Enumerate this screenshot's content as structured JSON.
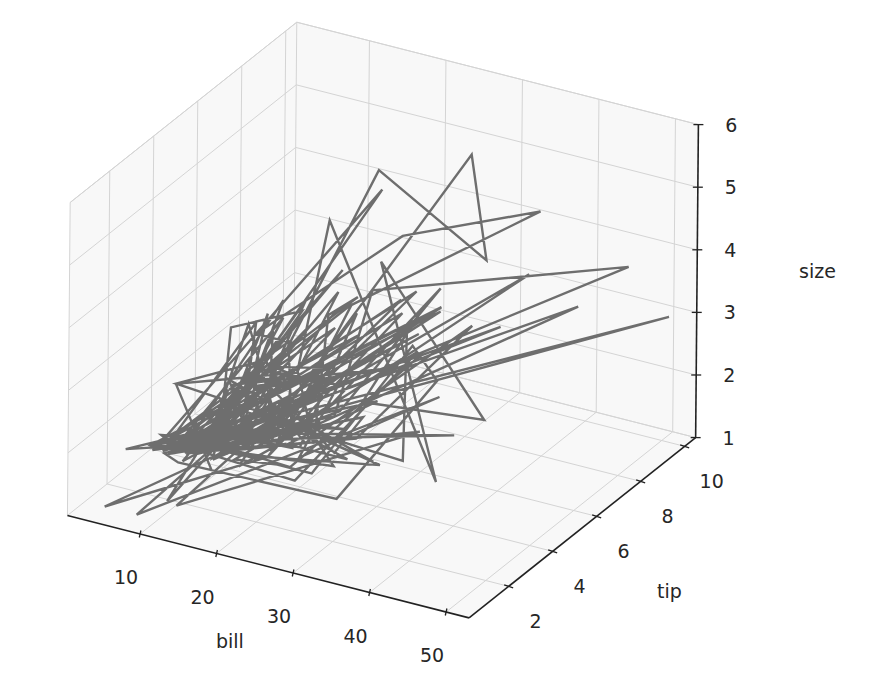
{
  "chart_data": {
    "type": "line3d",
    "title": "",
    "xlabel": "bill",
    "ylabel": "tip",
    "zlabel": "size",
    "x_ticks": [
      10,
      20,
      30,
      40,
      50
    ],
    "y_ticks": [
      2,
      4,
      6,
      8,
      10
    ],
    "z_ticks": [
      1,
      2,
      3,
      4,
      5,
      6
    ],
    "xlim": [
      0.5,
      53
    ],
    "ylim": [
      0.2,
      10.5
    ],
    "zlim": [
      1,
      6
    ],
    "grid": true,
    "legend": null,
    "series": [
      {
        "name": "tips",
        "color": "#6e6e6e",
        "bill": [
          16.99,
          10.34,
          21.01,
          23.68,
          24.59,
          25.29,
          8.77,
          26.88,
          15.04,
          14.78,
          10.27,
          35.26,
          15.42,
          18.43,
          14.83,
          21.58,
          10.33,
          16.29,
          16.97,
          20.65,
          17.92,
          20.29,
          15.77,
          39.42,
          19.82,
          17.81,
          13.37,
          12.69,
          21.7,
          19.65,
          9.55,
          18.35,
          15.06,
          20.69,
          17.78,
          24.06,
          16.31,
          16.93,
          18.69,
          31.27,
          16.04,
          17.46,
          13.94,
          9.68,
          30.4,
          18.29,
          22.23,
          32.4,
          28.55,
          18.04,
          12.54,
          10.29,
          34.81,
          9.94,
          25.56,
          19.49,
          38.01,
          26.41,
          11.24,
          48.27,
          20.29,
          13.81,
          11.02,
          18.29,
          17.59,
          20.08,
          16.45,
          3.07,
          20.23,
          15.01,
          12.02,
          17.07,
          26.86,
          25.28,
          14.73,
          10.51,
          17.92,
          27.2,
          22.76,
          17.29,
          19.44,
          16.66,
          10.07,
          32.68,
          15.98,
          34.83,
          13.03,
          18.28,
          24.71,
          21.16,
          28.97,
          22.49,
          5.75,
          16.32,
          22.75,
          40.17,
          27.28,
          12.03,
          21.01,
          12.46,
          11.35,
          15.38,
          44.3,
          22.42,
          20.92,
          15.36,
          20.49,
          25.21,
          18.24,
          14.31,
          14.0,
          7.25,
          38.07,
          23.95,
          25.71,
          17.31,
          29.93,
          10.65,
          12.43,
          24.08,
          11.69,
          13.42,
          14.26,
          15.95,
          12.48,
          29.8,
          8.52,
          14.52,
          11.38,
          22.82,
          19.08,
          20.27,
          11.17,
          12.26,
          18.26,
          8.51,
          10.33,
          14.15,
          16.0,
          13.16,
          17.47,
          34.3,
          41.19,
          27.05,
          16.43,
          8.35,
          18.64,
          11.87,
          9.78,
          7.51,
          14.07,
          13.13,
          17.26,
          24.55,
          19.77,
          29.85,
          48.17,
          25.0,
          13.39,
          16.49,
          21.5,
          12.66,
          16.21,
          13.81,
          17.51,
          24.52,
          20.76,
          31.71,
          10.59,
          10.63,
          50.81,
          15.81,
          7.25,
          31.85,
          16.82,
          32.9,
          17.89,
          14.48,
          9.6,
          34.63,
          34.65,
          23.33,
          45.35,
          23.17,
          40.55,
          20.69,
          20.9,
          30.46,
          18.15,
          23.1,
          15.69,
          19.81,
          28.44,
          15.48,
          16.58,
          7.56,
          10.34,
          43.11,
          13.0,
          13.51,
          18.71,
          12.74,
          13.0,
          16.4,
          20.53,
          16.47,
          26.59,
          38.73,
          24.27,
          12.76,
          30.06,
          25.89,
          48.33,
          13.27,
          28.17,
          12.9,
          28.15,
          11.59,
          7.74,
          30.14,
          12.16,
          13.42,
          8.58,
          15.98,
          13.42,
          16.27,
          10.09,
          20.45,
          13.28,
          22.12,
          24.01,
          15.69,
          11.61,
          10.77,
          15.53,
          10.07,
          12.6,
          32.83,
          35.83,
          29.03,
          27.18,
          22.67,
          17.82,
          18.78
        ],
        "tip": [
          1.01,
          1.66,
          3.5,
          3.31,
          3.61,
          4.71,
          2.0,
          3.12,
          1.96,
          3.23,
          1.71,
          5.0,
          1.57,
          3.0,
          3.02,
          3.92,
          1.67,
          3.71,
          3.5,
          3.35,
          4.08,
          2.75,
          2.23,
          7.58,
          3.18,
          2.34,
          2.0,
          2.0,
          4.3,
          3.0,
          1.45,
          2.5,
          3.0,
          2.45,
          3.27,
          3.6,
          2.0,
          3.07,
          2.31,
          5.0,
          2.24,
          2.54,
          3.06,
          1.32,
          5.6,
          3.0,
          5.0,
          6.0,
          2.05,
          3.0,
          2.5,
          2.6,
          5.2,
          1.56,
          4.34,
          3.51,
          3.0,
          1.5,
          1.76,
          6.73,
          3.21,
          2.0,
          1.98,
          3.76,
          2.64,
          3.15,
          2.47,
          1.0,
          2.01,
          2.09,
          1.97,
          3.0,
          3.14,
          5.0,
          2.2,
          1.25,
          3.08,
          4.0,
          3.0,
          2.71,
          3.0,
          3.4,
          1.83,
          5.0,
          2.03,
          5.17,
          2.0,
          4.0,
          5.85,
          3.0,
          3.0,
          3.5,
          1.0,
          4.3,
          3.25,
          4.73,
          4.0,
          1.5,
          3.0,
          1.5,
          2.5,
          3.0,
          2.5,
          3.48,
          4.08,
          1.64,
          4.06,
          4.29,
          3.76,
          4.0,
          3.0,
          1.0,
          4.0,
          2.55,
          4.0,
          3.5,
          5.07,
          1.5,
          1.8,
          2.92,
          2.31,
          1.68,
          2.5,
          2.0,
          2.52,
          4.2,
          1.48,
          2.0,
          2.0,
          2.18,
          1.5,
          2.83,
          1.5,
          2.0,
          3.25,
          1.25,
          2.0,
          2.0,
          2.0,
          2.75,
          3.5,
          6.7,
          5.0,
          5.0,
          2.3,
          1.5,
          1.36,
          1.63,
          1.73,
          2.0,
          2.5,
          2.0,
          2.74,
          2.0,
          2.0,
          5.14,
          5.0,
          3.75,
          2.61,
          2.0,
          3.5,
          2.5,
          2.0,
          2.0,
          3.0,
          3.48,
          2.24,
          4.5,
          1.61,
          2.0,
          10.0,
          3.16,
          5.15,
          3.18,
          4.0,
          3.11,
          2.0,
          2.0,
          4.0,
          3.55,
          3.68,
          5.65,
          3.5,
          6.5,
          3.0,
          5.0,
          3.5,
          2.0,
          3.5,
          4.0,
          1.5,
          4.19,
          2.56,
          2.02,
          4.0,
          1.44,
          2.0,
          5.0,
          2.0,
          2.0,
          4.0,
          2.01,
          2.0,
          2.5,
          4.0,
          3.23,
          3.41,
          3.0,
          2.03,
          2.23,
          2.0,
          5.16,
          9.0,
          2.5,
          6.5,
          1.1,
          3.0,
          1.5,
          1.44,
          3.09,
          2.2,
          3.48,
          1.92,
          3.0,
          1.58,
          2.5,
          2.0,
          3.0,
          2.72,
          2.88,
          2.0,
          3.0,
          3.39,
          1.47,
          3.0,
          1.25,
          1.0,
          1.17,
          4.67,
          5.92,
          2.0,
          2.0,
          1.75,
          3.0
        ],
        "size": [
          2,
          3,
          3,
          2,
          4,
          4,
          2,
          4,
          2,
          2,
          2,
          4,
          2,
          4,
          2,
          2,
          3,
          3,
          3,
          3,
          2,
          2,
          2,
          4,
          2,
          4,
          2,
          2,
          2,
          2,
          2,
          4,
          2,
          4,
          2,
          3,
          3,
          3,
          3,
          3,
          3,
          2,
          2,
          2,
          4,
          2,
          2,
          4,
          3,
          2,
          2,
          2,
          4,
          2,
          4,
          2,
          4,
          2,
          2,
          4,
          2,
          2,
          2,
          4,
          3,
          3,
          2,
          1,
          2,
          2,
          2,
          3,
          2,
          2,
          2,
          2,
          2,
          4,
          2,
          2,
          2,
          2,
          1,
          2,
          2,
          4,
          2,
          2,
          2,
          2,
          2,
          2,
          2,
          2,
          2,
          4,
          2,
          2,
          2,
          2,
          2,
          2,
          3,
          2,
          2,
          2,
          2,
          2,
          2,
          2,
          2,
          1,
          3,
          2,
          3,
          2,
          4,
          2,
          2,
          4,
          2,
          2,
          2,
          2,
          2,
          6,
          2,
          2,
          2,
          3,
          2,
          2,
          2,
          2,
          2,
          2,
          2,
          2,
          2,
          2,
          2,
          6,
          5,
          6,
          2,
          2,
          3,
          2,
          2,
          2,
          2,
          2,
          3,
          4,
          4,
          5,
          6,
          4,
          2,
          4,
          4,
          2,
          3,
          2,
          2,
          3,
          2,
          4,
          2,
          2,
          3,
          2,
          2,
          2,
          2,
          2,
          2,
          2,
          2,
          2,
          4,
          2,
          3,
          4,
          2,
          5,
          3,
          5,
          3,
          3,
          2,
          2,
          2,
          2,
          2,
          2,
          2,
          4,
          2,
          2,
          3,
          2,
          2,
          2,
          4,
          3,
          3,
          4,
          2,
          2,
          3,
          4,
          4,
          2,
          3,
          2,
          5,
          2,
          2,
          4,
          2,
          2,
          1,
          3,
          2,
          2,
          2,
          4,
          2,
          2,
          4,
          3,
          2,
          2,
          2,
          2,
          2,
          2,
          3,
          3,
          2,
          2,
          2,
          2
        ]
      }
    ],
    "axis_ranges_note": "bill ~0-53, tip ~0.2-10.5, size 1-6"
  }
}
